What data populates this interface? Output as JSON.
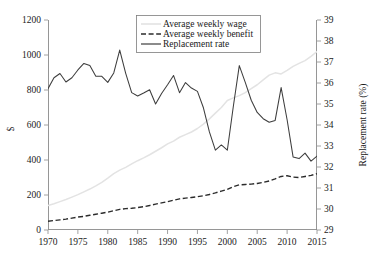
{
  "chart_data": {
    "type": "line",
    "title": "",
    "xlabel": "",
    "ylabel": "$",
    "y2label": "Replacement rate (%)",
    "xlim": [
      1970,
      2015
    ],
    "ylim": [
      0,
      1200
    ],
    "y2lim": [
      29,
      39
    ],
    "grid": false,
    "legend_position": "top-center",
    "x_ticks": [
      "1970",
      "1975",
      "1980",
      "1985",
      "1990",
      "1995",
      "2000",
      "2005",
      "2010",
      "2015"
    ],
    "y_ticks": [
      "0",
      "200",
      "400",
      "600",
      "800",
      "1000",
      "1200"
    ],
    "y2_ticks": [
      "29",
      "30",
      "31",
      "32",
      "33",
      "34",
      "35",
      "36",
      "37",
      "38",
      "39"
    ],
    "x": [
      1970,
      1971,
      1972,
      1973,
      1974,
      1975,
      1976,
      1977,
      1978,
      1979,
      1980,
      1981,
      1982,
      1983,
      1984,
      1985,
      1986,
      1987,
      1988,
      1989,
      1990,
      1991,
      1992,
      1993,
      1994,
      1995,
      1996,
      1997,
      1998,
      1999,
      2000,
      2001,
      2002,
      2003,
      2004,
      2005,
      2006,
      2007,
      2008,
      2009,
      2010,
      2011,
      2012,
      2013,
      2014,
      2015
    ],
    "series": [
      {
        "name": "Average weekly wage",
        "axis": "left",
        "style": "solid",
        "color": "#e3e3e3",
        "values": [
          140,
          150,
          162,
          174,
          188,
          202,
          218,
          234,
          252,
          272,
          296,
          322,
          342,
          358,
          378,
          396,
          412,
          430,
          450,
          470,
          492,
          508,
          530,
          545,
          560,
          580,
          605,
          635,
          668,
          700,
          740,
          755,
          768,
          785,
          808,
          830,
          858,
          885,
          898,
          892,
          912,
          935,
          952,
          968,
          992,
          1020
        ]
      },
      {
        "name": "Average weekly benefit",
        "axis": "left",
        "style": "dashed",
        "color": "#2b2b2b",
        "values": [
          50,
          54,
          58,
          62,
          68,
          74,
          78,
          84,
          90,
          96,
          102,
          110,
          118,
          122,
          124,
          128,
          133,
          140,
          148,
          155,
          162,
          170,
          178,
          182,
          186,
          190,
          196,
          203,
          212,
          222,
          232,
          248,
          258,
          260,
          262,
          266,
          272,
          280,
          292,
          306,
          310,
          302,
          300,
          306,
          312,
          322
        ]
      },
      {
        "name": "Replacement rate",
        "axis": "right",
        "style": "solid",
        "color": "#3d3d3d",
        "values": [
          35.73,
          36.25,
          36.45,
          36.05,
          36.25,
          36.62,
          36.93,
          36.83,
          36.32,
          36.32,
          36.03,
          36.48,
          37.57,
          36.46,
          35.54,
          35.38,
          35.52,
          35.68,
          35.0,
          35.5,
          35.92,
          36.36,
          35.54,
          36.02,
          35.76,
          35.6,
          34.82,
          33.67,
          32.8,
          33.05,
          32.8,
          34.88,
          36.83,
          36.03,
          35.18,
          34.6,
          34.3,
          34.13,
          34.22,
          35.78,
          34.25,
          32.48,
          32.4,
          32.66,
          32.28,
          32.52
        ]
      }
    ]
  },
  "legend": {
    "items": [
      {
        "label": "Average weekly wage"
      },
      {
        "label": "Average weekly benefit"
      },
      {
        "label": "Replacement rate"
      }
    ]
  },
  "axes": {
    "left_title": "$",
    "right_title": "Replacement rate (%)"
  }
}
